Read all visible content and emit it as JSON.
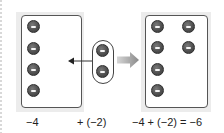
{
  "diagram": {
    "left_box": {
      "value": -4,
      "counter_count": 4,
      "counter_sign": "negative"
    },
    "added_group": {
      "value": -2,
      "counter_count": 2,
      "counter_sign": "negative"
    },
    "result_box": {
      "value": -6,
      "counter_count": 6,
      "counter_sign": "negative"
    },
    "icons": {
      "counter": "negative-counter-icon",
      "move_arrow": "arrow-left-icon",
      "result_arrow": "arrow-right-icon"
    },
    "colors": {
      "counter": "#505050",
      "panel": "#ececec",
      "arrow": "#9a9a9a",
      "outline": "#555555"
    }
  },
  "labels": {
    "left": "−4",
    "middle": "+ (−2)",
    "right": "−4 + (−2) = −6"
  }
}
